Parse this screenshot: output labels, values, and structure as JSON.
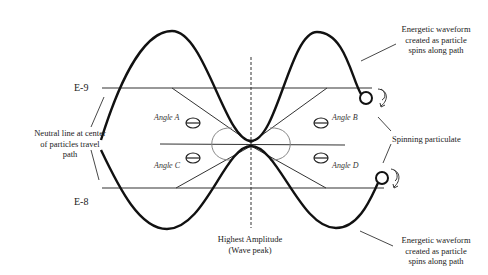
{
  "diagram": {
    "levels": {
      "upper": "E-9",
      "lower": "E-8"
    },
    "angles": [
      "Angle A",
      "Angle B",
      "Angle C",
      "Angle D"
    ],
    "annotations": {
      "neutral_line": [
        "Neutral line at center",
        "of particles travel",
        "path"
      ],
      "waveform_top": [
        "Energetic waveform",
        "created as particle",
        "spins along path"
      ],
      "waveform_bottom": [
        "Energetic waveform",
        "created as particle",
        "spins along path"
      ],
      "spinning": "Spinning particulate",
      "amplitude": [
        "Highest Amplitude",
        "(Wave peak)"
      ]
    },
    "colors": {
      "line": "#111111",
      "thin_line": "#333333",
      "arc": "#777777",
      "background": "#ffffff"
    }
  }
}
